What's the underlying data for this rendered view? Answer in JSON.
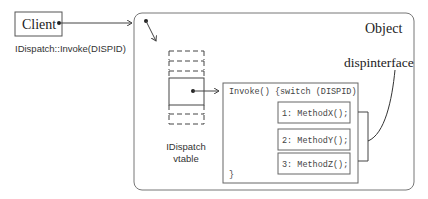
{
  "client": {
    "label": "Client",
    "call_label": "IDispatch::Invoke(DISPID)"
  },
  "object": {
    "label": "Object",
    "dispinterface_label": "dispinterface"
  },
  "vtable": {
    "label_line1": "IDispatch",
    "label_line2": "vtable"
  },
  "invoke_box": {
    "header": "Invoke() {switch (DISPID)",
    "closing": "}",
    "methods": [
      {
        "label": "1: MethodX();"
      },
      {
        "label": "2: MethodY();"
      },
      {
        "label": "3: MethodZ();"
      }
    ]
  },
  "colors": {
    "line": "#555555",
    "object_border": "#777777",
    "text": "#222222"
  }
}
